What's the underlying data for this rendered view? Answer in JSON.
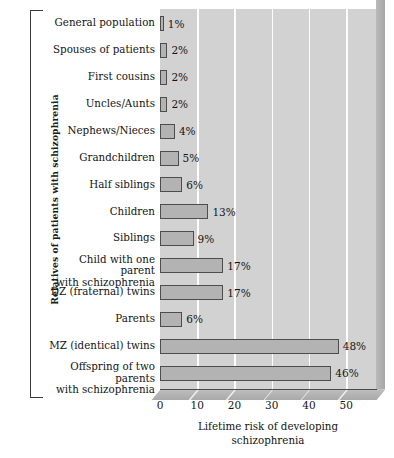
{
  "chart_data": {
    "type": "bar",
    "orientation": "horizontal",
    "title": "",
    "xlabel": "Lifetime risk of developing\nschizophrenia",
    "ylabel": "Relatives of patients with schizophrenia",
    "xlim": [
      0,
      58
    ],
    "xticks": [
      0,
      10,
      20,
      30,
      40,
      50
    ],
    "xtick_labels": [
      "0",
      "10",
      "20",
      "30",
      "40",
      "50"
    ],
    "grid": "vertical-white",
    "legend": "none",
    "unit": "%",
    "categories": [
      "General population",
      "Spouses of patients",
      "First cousins",
      "Uncles/Aunts",
      "Nephews/Nieces",
      "Grandchildren",
      "Half siblings",
      "Children",
      "Siblings",
      "Child with one parent\nwith schizophrenia",
      "DZ (fraternal) twins",
      "Parents",
      "MZ (identical) twins",
      "Offspring of two parents\nwith schizophrenia"
    ],
    "values": [
      1,
      2,
      2,
      2,
      4,
      5,
      6,
      13,
      9,
      17,
      17,
      6,
      48,
      46
    ],
    "value_labels": [
      "1%",
      "2%",
      "2%",
      "2%",
      "4%",
      "5%",
      "6%",
      "13%",
      "9%",
      "17%",
      "17%",
      "6%",
      "48%",
      "46%"
    ],
    "colors": {
      "bar_fill": "#b3b3b3",
      "bar_edge": "#4d4d4d",
      "plot_background": "#d2d2d2",
      "gridline": "#fdfdfd",
      "text": "#141414",
      "page_background": "#ffffff"
    }
  }
}
